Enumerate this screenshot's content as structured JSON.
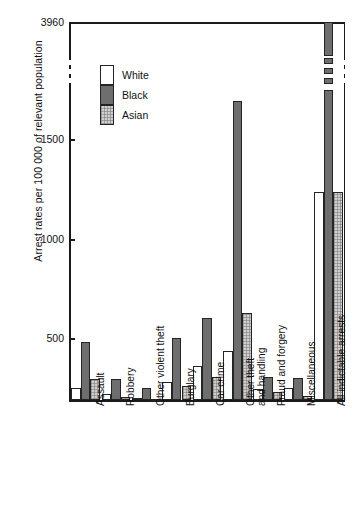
{
  "chart_data": {
    "type": "bar",
    "title": "",
    "xlabel": "",
    "ylabel": "Arrest rates per 100 000 of relevant population",
    "ylim": [
      185,
      3960
    ],
    "ytick_labels": [
      "500",
      "1000",
      "1500",
      "3960"
    ],
    "yticks": [
      500,
      1000,
      1500,
      3960
    ],
    "axis_broken": true,
    "grid": false,
    "legend_position": "inside-top-left",
    "categories": [
      "Assault",
      "Robbery",
      "Other violent theft",
      "Burglary",
      "Car crime",
      "Other theft\nand handling",
      "Fraud and forgery",
      "Miscellaneous",
      "All indictable arrests"
    ],
    "series": [
      {
        "name": "White",
        "color": "#ffffff",
        "values": [
          245,
          215,
          195,
          275,
          355,
          435,
          240,
          245,
          1240
        ]
      },
      {
        "name": "Black",
        "color": "#6e6e6e",
        "values": [
          478,
          290,
          245,
          498,
          600,
          1700,
          300,
          295,
          3960
        ]
      },
      {
        "name": "Asian",
        "color": "#cfcfcf",
        "values": [
          290,
          200,
          190,
          255,
          300,
          625,
          225,
          205,
          1240
        ]
      }
    ]
  },
  "axis": {
    "y_title": "Arrest rates per 100 000 of relevant population",
    "tick_3960": "3960",
    "tick_1500": "1500",
    "tick_1000": "1000",
    "tick_500": "500"
  },
  "legend": {
    "items": [
      {
        "label": "White",
        "swatch": "white"
      },
      {
        "label": "Black",
        "swatch": "black"
      },
      {
        "label": "Asian",
        "swatch": "asian"
      }
    ]
  },
  "categories": {
    "c0": "Assault",
    "c1": "Robbery",
    "c2": "Other violent theft",
    "c3": "Burglary",
    "c4": "Car crime",
    "c5a": "Other theft",
    "c5b": "and handling",
    "c6": "Fraud and forgery",
    "c7": "Miscellaneous",
    "c8": "All indictable arrests"
  }
}
